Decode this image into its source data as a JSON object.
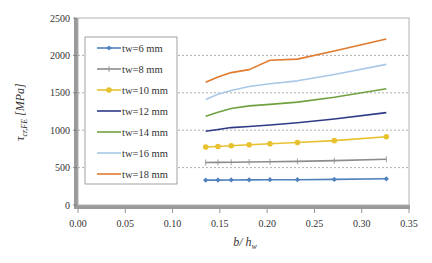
{
  "chart_data": {
    "type": "line",
    "title": "",
    "xlabel": "b/ h_w",
    "ylabel": "τ_cr,FE [MPa]",
    "xlim": [
      0,
      0.35
    ],
    "ylim": [
      0,
      2500
    ],
    "xticks": [
      "0.00",
      "0.05",
      "0.10",
      "0.15",
      "0.20",
      "0.25",
      "0.30",
      "0.35"
    ],
    "yticks": [
      "0",
      "500",
      "1000",
      "1500",
      "2000",
      "2500"
    ],
    "grid": "horizontal dashed at 500, 1000, 1500, 2000",
    "legend_position": "inside upper-left",
    "x": [
      0.135,
      0.148,
      0.162,
      0.181,
      0.203,
      0.232,
      0.271,
      0.326
    ],
    "series": [
      {
        "name": "tw=6 mm",
        "color": "#4f81bd",
        "marker": "diamond",
        "values": [
          332,
          333,
          335,
          336,
          338,
          338,
          342,
          350
        ]
      },
      {
        "name": "tw=8 mm",
        "color": "#8c8c8c",
        "marker": "plus",
        "values": [
          568,
          570,
          572,
          575,
          578,
          583,
          593,
          612
        ]
      },
      {
        "name": "tw=10 mm",
        "color": "#e8c12f",
        "marker": "circle",
        "values": [
          775,
          783,
          793,
          805,
          818,
          835,
          860,
          913
        ]
      },
      {
        "name": "tw=12 mm",
        "color": "#2e3a87",
        "marker": "none",
        "values": [
          985,
          1010,
          1035,
          1050,
          1070,
          1100,
          1150,
          1235
        ]
      },
      {
        "name": "tw=14 mm",
        "color": "#70a040",
        "marker": "none",
        "values": [
          1185,
          1240,
          1290,
          1325,
          1345,
          1375,
          1440,
          1555
        ]
      },
      {
        "name": "tw=16 mm",
        "color": "#a9c8e8",
        "marker": "none",
        "values": [
          1410,
          1480,
          1530,
          1585,
          1620,
          1660,
          1745,
          1880
        ]
      },
      {
        "name": "tw=18 mm",
        "color": "#e07a2e",
        "marker": "none",
        "values": [
          1640,
          1710,
          1770,
          1810,
          1935,
          1950,
          2060,
          2220
        ]
      }
    ]
  }
}
